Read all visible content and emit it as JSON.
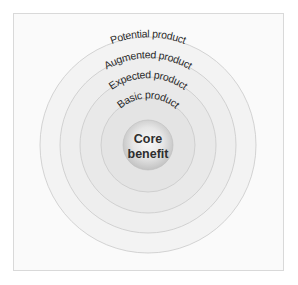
{
  "diagram": {
    "type": "concentric-circles",
    "core": {
      "line1": "Core",
      "line2": "benefit"
    },
    "rings": [
      {
        "label": "Basic product"
      },
      {
        "label": "Expected product"
      },
      {
        "label": "Augmented product"
      },
      {
        "label": "Potential product"
      }
    ],
    "colors": {
      "frame_border": "#d9d9d9",
      "frame_fill": "#fafafa",
      "ring_stroke": "#c9c9c9",
      "potential_fill": "#f3f3f3",
      "augmented_fill": "#eeeeee",
      "expected_fill": "#e9e9e9",
      "basic_fill": "#e4e4e4",
      "core_center": "#f7f7f7",
      "core_edge": "#c4c4c4",
      "text": "#2a2a2a"
    }
  }
}
